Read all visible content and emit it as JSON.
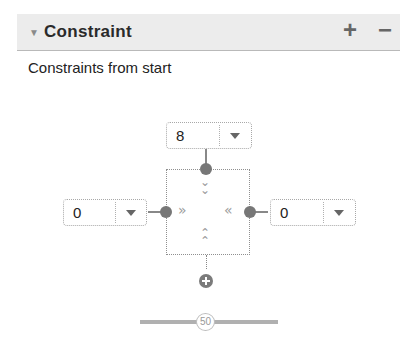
{
  "panel": {
    "title": "Constraint",
    "collapse_icon": "▼",
    "add_label": "+",
    "remove_label": "−"
  },
  "subtitle": "Constraints from start",
  "constraint_widget": {
    "top": {
      "value": "8"
    },
    "left": {
      "value": "0"
    },
    "right": {
      "value": "0"
    },
    "arrows": {
      "top": "⌄⌄",
      "left": "»",
      "right": "«",
      "bottom": "⌃⌃"
    }
  },
  "bias_slider": {
    "value": "50"
  }
}
